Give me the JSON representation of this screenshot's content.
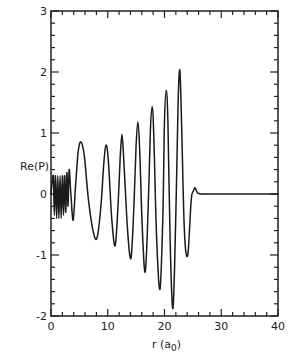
{
  "chart_data": {
    "type": "line",
    "title": "",
    "xlabel": "r (a0)",
    "xlabel_main": "r (a",
    "xlabel_sub": "0",
    "xlabel_close": ")",
    "ylabel": "Re(P)",
    "xlim": [
      0,
      40
    ],
    "ylim": [
      -2,
      3
    ],
    "grid": false,
    "legend": null,
    "x_ticks": [
      0,
      10,
      20,
      30,
      40
    ],
    "x_tick_labels": [
      "0",
      "10",
      "20",
      "30",
      "40"
    ],
    "y_ticks": [
      -2,
      -1,
      0,
      1,
      2,
      3
    ],
    "y_tick_labels": [
      "-2",
      "-1",
      "0",
      "1",
      "2",
      "3"
    ],
    "series": [
      {
        "name": "Re(P)",
        "x": [
          0.0,
          0.4,
          0.6,
          0.8,
          1.0,
          1.2,
          1.4,
          1.6,
          1.8,
          2.0,
          2.2,
          2.4,
          2.6,
          2.8,
          3.0,
          3.2,
          3.5,
          3.9,
          4.3,
          4.8,
          5.3,
          5.9,
          6.6,
          7.4,
          8.1,
          8.8,
          9.3,
          9.7,
          10.1,
          10.7,
          11.3,
          11.8,
          12.2,
          12.5,
          12.8,
          13.5,
          14.1,
          14.6,
          15.0,
          15.3,
          15.6,
          16.1,
          16.6,
          17.1,
          17.5,
          17.8,
          18.1,
          18.6,
          19.2,
          19.7,
          20.0,
          20.3,
          20.6,
          21.0,
          21.5,
          22.0,
          22.4,
          22.7,
          23.0,
          23.5,
          24.1,
          24.7,
          25.1,
          25.4,
          25.8,
          26.5,
          28.0,
          40.0
        ],
        "y": [
          0.0,
          0.3,
          -0.35,
          0.3,
          -0.4,
          0.3,
          -0.4,
          0.3,
          -0.4,
          0.3,
          -0.35,
          0.3,
          -0.3,
          0.35,
          -0.2,
          0.4,
          0.0,
          -0.43,
          0.1,
          0.7,
          0.85,
          0.6,
          -0.1,
          -0.6,
          -0.72,
          -0.2,
          0.5,
          0.8,
          0.55,
          -0.4,
          -0.85,
          -0.2,
          0.6,
          0.98,
          0.6,
          -0.6,
          -1.05,
          -0.2,
          0.8,
          1.18,
          0.8,
          -0.6,
          -1.28,
          -0.3,
          1.0,
          1.43,
          1.0,
          -0.7,
          -1.56,
          -0.4,
          1.2,
          1.7,
          1.2,
          -0.8,
          -1.87,
          -0.3,
          1.5,
          2.03,
          1.2,
          -0.6,
          -1.0,
          -0.1,
          0.05,
          0.1,
          0.02,
          0.0,
          0.0,
          0.0
        ]
      }
    ],
    "annotations": []
  },
  "layout": {
    "plot_box": {
      "left": 51,
      "top": 11,
      "right": 278,
      "bottom": 316
    },
    "line_color": "#1a1a1a",
    "axis_color": "#222222"
  }
}
